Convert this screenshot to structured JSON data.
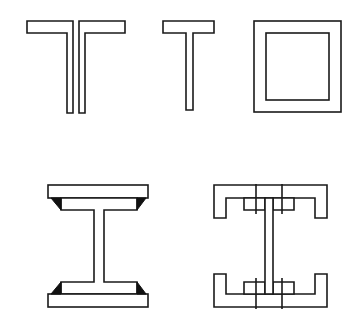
{
  "figure": {
    "shapes": [
      {
        "id": "double-tee",
        "label": "Double T section (two tees back to back)"
      },
      {
        "id": "single-tee",
        "label": "T section"
      },
      {
        "id": "box-section",
        "label": "Hollow square box section"
      },
      {
        "id": "welded-i-beam",
        "label": "Welded I-beam with fillet welds"
      },
      {
        "id": "built-up-section",
        "label": "Built-up I section with channels and angles, bolted"
      }
    ],
    "colors": {
      "stroke": "#1a1a1a",
      "fill": "#ffffff",
      "weld": "#111111"
    }
  }
}
